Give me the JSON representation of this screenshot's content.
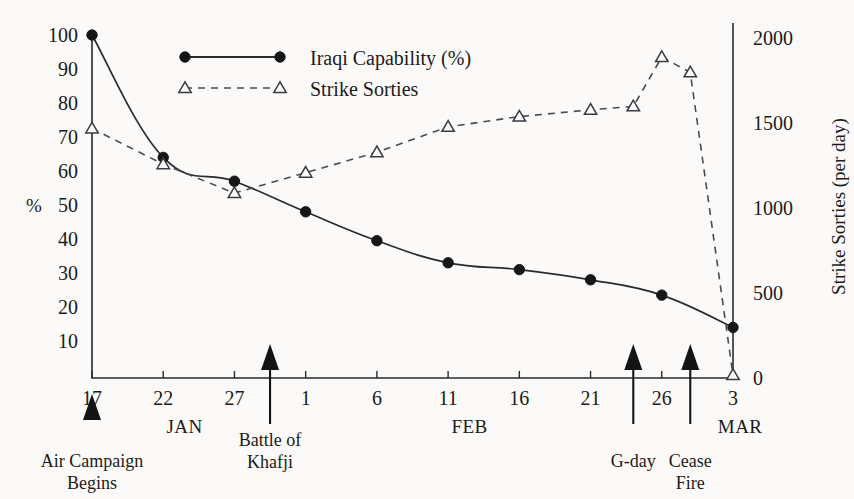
{
  "chart_data": {
    "type": "line",
    "title": "",
    "subtitle": "",
    "xlabel": "",
    "ylabel": "%",
    "y2label": "Strike Sorties (per day)",
    "grid": false,
    "legend_position": "top-center",
    "ylim": [
      0,
      105
    ],
    "y2lim": [
      0,
      2100
    ],
    "xlim": [
      "JAN 17",
      "MAR 3"
    ],
    "x_tick_labels": [
      "17",
      "22",
      "27",
      "1",
      "6",
      "11",
      "16",
      "21",
      "26",
      "3"
    ],
    "x_tick_days": [
      0,
      5,
      10,
      15,
      20,
      25,
      30,
      35,
      40,
      45
    ],
    "month_labels": [
      "JAN",
      "FEB",
      "MAR"
    ],
    "y_tick_labels": [
      "100",
      "90",
      "80",
      "70",
      "60",
      "50",
      "40",
      "30",
      "20",
      "10"
    ],
    "y_tick_values": [
      100,
      90,
      80,
      70,
      60,
      50,
      40,
      30,
      20,
      10
    ],
    "y2_tick_labels": [
      "2000",
      "1500",
      "1000",
      "500",
      "0"
    ],
    "y2_tick_values": [
      2000,
      1500,
      1000,
      500,
      0
    ],
    "series": [
      {
        "name": "Iraqi Capability (%)",
        "axis": "left",
        "style": "solid",
        "marker": "filled-circle",
        "x_days": [
          0,
          5,
          10,
          15,
          20,
          25,
          30,
          35,
          40,
          45
        ],
        "x_labels": [
          "Jan 17",
          "Jan 22",
          "Jan 27",
          "Feb 1",
          "Feb 6",
          "Feb 11",
          "Feb 16",
          "Feb 21",
          "Feb 26",
          "Mar 3"
        ],
        "values": [
          100,
          64,
          57,
          48,
          39.5,
          33,
          31,
          28,
          23.5,
          14
        ]
      },
      {
        "name": "Strike Sorties",
        "axis": "right",
        "style": "dashed",
        "marker": "open-triangle",
        "x_days": [
          0,
          5,
          10,
          15,
          20,
          25,
          30,
          35,
          38,
          40,
          42,
          45
        ],
        "x_labels": [
          "Jan 17",
          "Jan 22",
          "Jan 27",
          "Feb 1",
          "Feb 6",
          "Feb 11",
          "Feb 16",
          "Feb 21",
          "Feb 24",
          "Feb 26",
          "Feb 28",
          "Mar 3"
        ],
        "values_pct_scale": [
          72.5,
          62,
          53.5,
          59.5,
          65.5,
          73,
          76,
          78,
          79,
          93.5,
          89,
          0
        ],
        "values": [
          1450,
          1240,
          1070,
          1190,
          1310,
          1460,
          1520,
          1560,
          1580,
          1870,
          1780,
          0
        ]
      }
    ],
    "annotations": [
      {
        "label_line1": "Air Campaign",
        "label_line2": "Begins",
        "x_day": 0
      },
      {
        "label_line1": "Battle of",
        "label_line2": "Khafji",
        "x_day": 12.5
      },
      {
        "label_line1": "G-day",
        "label_line2": "",
        "x_day": 38
      },
      {
        "label_line1": "Cease",
        "label_line2": "Fire",
        "x_day": 42
      }
    ]
  },
  "legend": {
    "items": [
      {
        "label": "Iraqi Capability (%)",
        "style": "solid",
        "marker": "filled-circle"
      },
      {
        "label": "Strike Sorties",
        "style": "dashed",
        "marker": "open-triangle"
      }
    ]
  },
  "axes": {
    "left_unit_label": "%",
    "right_title": "Strike Sorties (per day)"
  },
  "colors": {
    "ink": "#1b1b1b",
    "capability_line": "#2b2b2b",
    "sorties_line": "#4a4a52",
    "background": "#fbfaf8"
  }
}
